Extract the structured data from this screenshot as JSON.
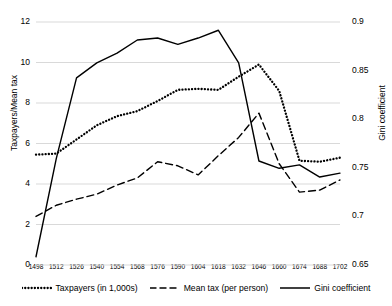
{
  "chart_data": {
    "type": "line",
    "title": "",
    "xlabel": "",
    "ylabel": "Taxpayers/Mean tax",
    "ylabel_secondary": "Gini coefficient",
    "grid": true,
    "legend_position": "bottom",
    "categories": [
      1498,
      1512,
      1526,
      1540,
      1554,
      1568,
      1576,
      1590,
      1604,
      1618,
      1632,
      1646,
      1660,
      1674,
      1688,
      1702
    ],
    "xtick_labels": [
      "1498",
      "1512",
      "1526",
      "1540",
      "1554",
      "1568",
      "1576",
      "1590",
      "1604",
      "1618",
      "1632",
      "1646",
      "1660",
      "1674",
      "1688",
      "1702"
    ],
    "left_axis": {
      "label": "Taxpayers/Mean tax",
      "ticks": [
        0,
        2,
        4,
        6,
        8,
        10,
        12
      ],
      "tick_labels": [
        "0",
        "2",
        "4",
        "6",
        "8",
        "10",
        "12"
      ],
      "ylim": [
        0,
        12
      ]
    },
    "right_axis": {
      "label": "Gini coefficient",
      "ticks": [
        0.65,
        0.7,
        0.75,
        0.8,
        0.85,
        0.9
      ],
      "tick_labels": [
        "0.65",
        "0.7",
        "0.75",
        "0.8",
        "0.85",
        "0.9"
      ],
      "ylim": [
        0.65,
        0.9
      ]
    },
    "series": [
      {
        "name": "Taxpayers (in 1,000s)",
        "axis": "left",
        "style": "dotted",
        "color": "#000000",
        "values": [
          5.45,
          5.5,
          6.2,
          6.9,
          7.35,
          7.6,
          8.1,
          8.65,
          8.7,
          8.65,
          9.3,
          9.9,
          8.6,
          5.15,
          5.1,
          5.3
        ]
      },
      {
        "name": "Mean tax (per person)",
        "axis": "left",
        "style": "dashed",
        "color": "#000000",
        "values": [
          2.4,
          2.95,
          3.25,
          3.5,
          3.95,
          4.3,
          5.1,
          4.9,
          4.45,
          5.4,
          6.3,
          7.5,
          5.0,
          3.6,
          3.7,
          4.2
        ]
      },
      {
        "name": "Gini coefficient",
        "axis": "right",
        "style": "solid",
        "color": "#000000",
        "values": [
          0.6585,
          0.7595,
          0.8425,
          0.858,
          0.868,
          0.8815,
          0.8835,
          0.877,
          0.8835,
          0.8915,
          0.858,
          0.757,
          0.7495,
          0.753,
          0.7405,
          0.7445
        ]
      }
    ]
  },
  "legend": {
    "items": [
      {
        "label": "Taxpayers (in 1,000s)",
        "style": "dotted"
      },
      {
        "label": "Mean tax (per person)",
        "style": "dashed"
      },
      {
        "label": "Gini coefficient",
        "style": "solid"
      }
    ]
  }
}
